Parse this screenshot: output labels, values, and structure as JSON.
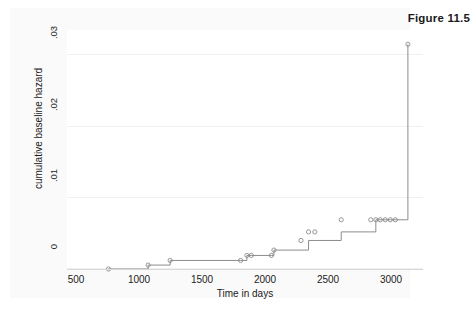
{
  "figure": {
    "caption": "Figure 11.5"
  },
  "chart_data": {
    "type": "line",
    "subtype": "step-cumulative-hazard",
    "title": "Figure 11.5",
    "xlabel": "Time in days",
    "ylabel": "cumulative baseline hazard",
    "xlim": [
      430,
      3260
    ],
    "ylim": [
      0,
      0.0335
    ],
    "grid": true,
    "grid_orientation": "horizontal",
    "legend": "none",
    "line_color": "#8c8c8c",
    "marker_shape": "open-circle",
    "marker_color": "#8c8c8c",
    "xticks": [
      500,
      1000,
      1500,
      2000,
      2500,
      3000
    ],
    "xtick_labels": [
      "500",
      "1000",
      "1500",
      "2000",
      "2500",
      "3000"
    ],
    "yticks": [
      0,
      0.01,
      0.02,
      0.03
    ],
    "ytick_labels": [
      "0",
      ".01",
      ".02",
      ".03"
    ],
    "series": [
      {
        "name": "cumulative baseline hazard",
        "x": [
          760,
          1075,
          1250,
          1810,
          1860,
          1895,
          2055,
          2075,
          2290,
          2350,
          2400,
          2610,
          2845,
          2885,
          2920,
          2960,
          3000,
          3040,
          3140
        ],
        "y": [
          0.0,
          0.00055,
          0.0012,
          0.0012,
          0.0019,
          0.0019,
          0.0019,
          0.00265,
          0.00265,
          0.004,
          0.004,
          0.0052,
          0.0052,
          0.0069,
          0.0069,
          0.0069,
          0.0069,
          0.0069,
          0.0315
        ],
        "marker_x": [
          760,
          1075,
          1250,
          1810,
          1860,
          1895,
          2055,
          2075,
          2290,
          2350,
          2400,
          2610,
          2845,
          2885,
          2920,
          2960,
          3000,
          3040,
          3140
        ],
        "marker_y": [
          0.0,
          0.00055,
          0.0012,
          0.0012,
          0.0019,
          0.0019,
          0.0019,
          0.00265,
          0.004,
          0.0052,
          0.0052,
          0.0069,
          0.0069,
          0.0069,
          0.0069,
          0.0069,
          0.0069,
          0.0069,
          0.0315
        ]
      }
    ]
  }
}
